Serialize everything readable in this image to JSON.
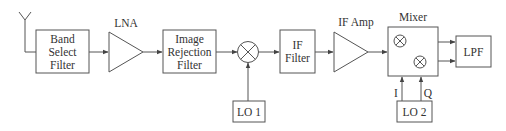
{
  "diagram": {
    "type": "rf-receiver-block-diagram",
    "blocks": {
      "band_select": [
        "Band",
        "Select",
        "Filter"
      ],
      "lna": "LNA",
      "image_rejection": [
        "Image",
        "Rejection",
        "Filter"
      ],
      "lo1": "LO 1",
      "if_filter": [
        "IF",
        "Filter"
      ],
      "if_amp": "IF Amp",
      "mixer": "Mixer",
      "lpf": "LPF",
      "lo2": "LO 2"
    },
    "signal_labels": {
      "i": "I",
      "q": "Q"
    },
    "colors": {
      "line": "#555555",
      "text": "#333333",
      "background": "#ffffff"
    }
  }
}
